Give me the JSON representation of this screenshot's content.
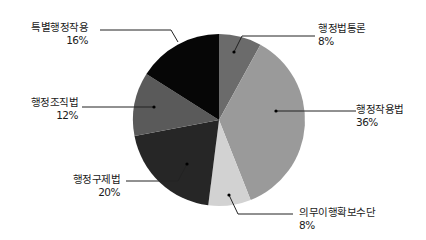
{
  "chart_data": {
    "type": "pie",
    "title": "",
    "start_angle_deg": 0,
    "direction": "clockwise",
    "slices": [
      {
        "label": "행정법통론",
        "value": 8,
        "pct_label": "8%",
        "color": "#6b6b6b"
      },
      {
        "label": "행정작용법",
        "value": 36,
        "pct_label": "36%",
        "color": "#9a9a9a"
      },
      {
        "label": "의무이행확보수단",
        "value": 8,
        "pct_label": "8%",
        "color": "#d2d2d2"
      },
      {
        "label": "행정구제법",
        "value": 20,
        "pct_label": "20%",
        "color": "#262626"
      },
      {
        "label": "행정조직법",
        "value": 12,
        "pct_label": "12%",
        "color": "#5a5a5a"
      },
      {
        "label": "특별행정작용",
        "value": 16,
        "pct_label": "16%",
        "color": "#060606"
      }
    ],
    "legend": "callout labels"
  },
  "labels": {
    "s0": {
      "name": "행정법통론",
      "pct": "8%"
    },
    "s1": {
      "name": "행정작용법",
      "pct": "36%"
    },
    "s2": {
      "name": "의무이행확보수단",
      "pct": "8%"
    },
    "s3": {
      "name": "행정구제법",
      "pct": "20%"
    },
    "s4": {
      "name": "행정조직법",
      "pct": "12%"
    },
    "s5": {
      "name": "특별행정작용",
      "pct": "16%"
    }
  }
}
